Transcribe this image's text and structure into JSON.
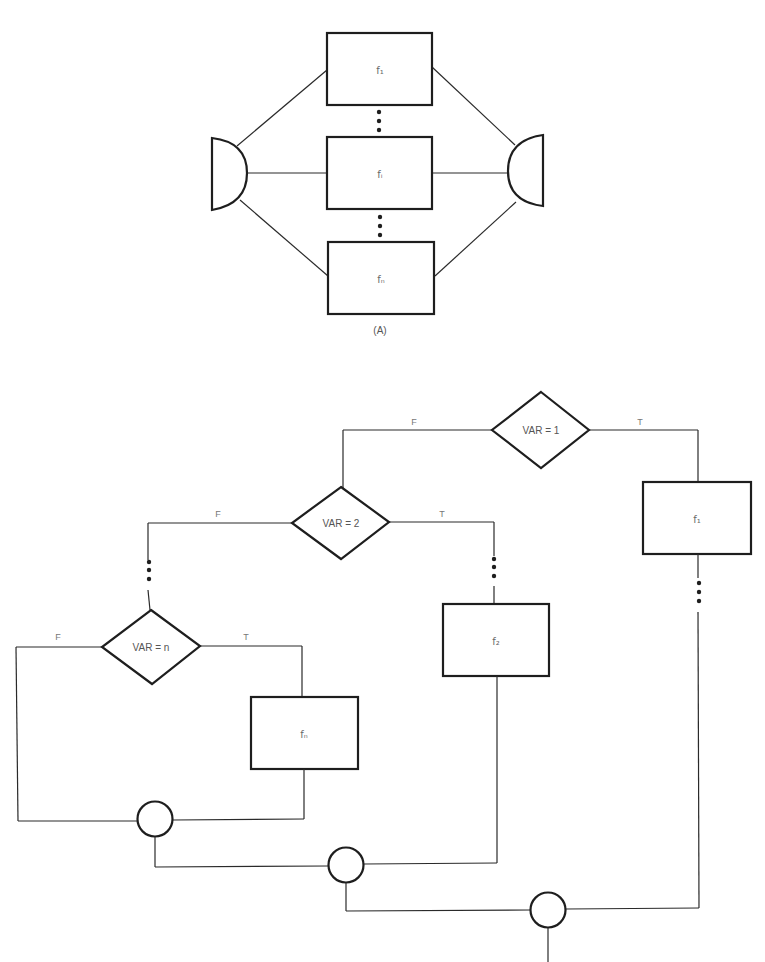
{
  "figure_a": {
    "caption": "(A)",
    "boxes": [
      {
        "label": "f₁"
      },
      {
        "label": "fᵢ"
      },
      {
        "label": "fₙ"
      }
    ],
    "input_shape": "fork-half-circle",
    "output_shape": "join-half-circle"
  },
  "figure_b": {
    "decisions": [
      {
        "condition": "VAR = 1",
        "false_label": "F",
        "true_label": "T"
      },
      {
        "condition": "VAR = 2",
        "false_label": "F",
        "true_label": "T"
      },
      {
        "condition": "VAR = n",
        "false_label": "F",
        "true_label": "T"
      }
    ],
    "boxes": [
      {
        "label": "f₁"
      },
      {
        "label": "f₂"
      },
      {
        "label": "fₙ"
      }
    ],
    "junctions": 3
  },
  "colors": {
    "line": "#2a2a2a",
    "background": "#ffffff"
  }
}
